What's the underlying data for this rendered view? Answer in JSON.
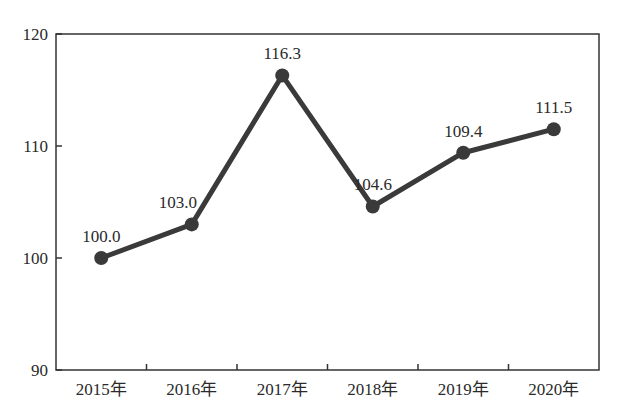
{
  "chart_data": {
    "type": "line",
    "title": "",
    "xlabel": "",
    "ylabel": "",
    "categories": [
      "2015年",
      "2016年",
      "2017年",
      "2018年",
      "2019年",
      "2020年"
    ],
    "series": [
      {
        "name": "index",
        "values": [
          100.0,
          103.0,
          116.3,
          104.6,
          109.4,
          111.5
        ]
      }
    ],
    "data_labels": [
      "100.0",
      "103.0",
      "116.3",
      "104.6",
      "109.4",
      "111.5"
    ],
    "ylim": [
      90,
      120
    ],
    "yticks": [
      90,
      100,
      110,
      120
    ],
    "ytick_labels": [
      "90",
      "100",
      "110",
      "120"
    ],
    "grid": false,
    "legend": null,
    "colors": {
      "line": "#3a3a3a",
      "marker": "#3a3a3a",
      "axis": "#333333"
    }
  }
}
